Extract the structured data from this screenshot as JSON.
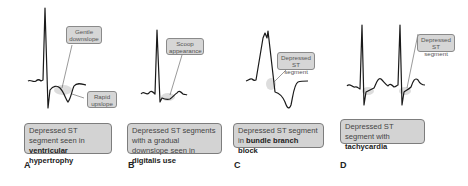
{
  "panels": [
    {
      "letter": "A",
      "callouts": [
        {
          "text": "Gentle downslope"
        },
        {
          "text": "Rapid upslope"
        }
      ],
      "caption": {
        "prefix": "Depressed ST segment seen in ",
        "bold": "ventricular hypertrophy"
      }
    },
    {
      "letter": "B",
      "callouts": [
        {
          "text": "Scoop appearance"
        }
      ],
      "caption": {
        "prefix": "Depressed ST segments with a gradual downslope seen in ",
        "bold": "digitalis use"
      }
    },
    {
      "letter": "C",
      "callouts": [
        {
          "text": "Depressed ST segment"
        }
      ],
      "caption": {
        "prefix": "Depressed ST segment in ",
        "bold": "bundle branch block"
      }
    },
    {
      "letter": "D",
      "callouts": [
        {
          "text": "Depressed ST segment"
        }
      ],
      "caption": {
        "prefix": "Depressed ST segment with ",
        "bold": "tachycardia"
      }
    }
  ],
  "colors": {
    "trace": "#1a1a1a",
    "callout_fill": "#d6d6d6",
    "callout_border": "#8a8a8a",
    "highlight": "#cfcfcf"
  }
}
